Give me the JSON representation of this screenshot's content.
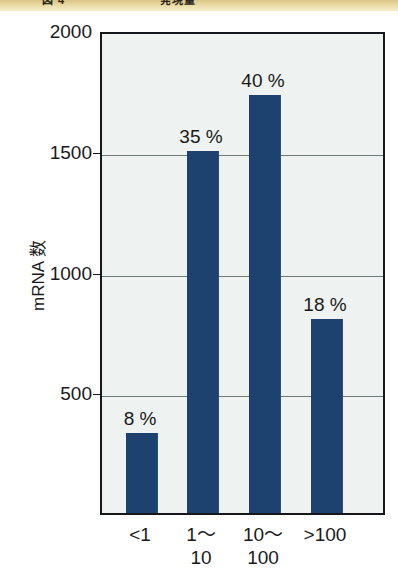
{
  "banner": {
    "left_fragment": "図 4",
    "right_fragment": "発現量"
  },
  "chart_data": {
    "type": "bar",
    "title": "",
    "subtitle": "",
    "xlabel": "",
    "ylabel": "mRNA 数",
    "ylim": [
      0,
      2000
    ],
    "grid": true,
    "legend": "none",
    "categories": [
      "<1",
      "1〜\n10",
      "10〜\n100",
      ">100"
    ],
    "category_plain": [
      "<1",
      "1〜10",
      "10〜100",
      ">100"
    ],
    "values": [
      330,
      1500,
      1730,
      805
    ],
    "data_labels": [
      "8 %",
      "35 %",
      "40 %",
      "18 %"
    ],
    "percentages": [
      8,
      35,
      40,
      18
    ],
    "yticks": [
      2000,
      1500,
      1000,
      500
    ],
    "ytick_labels": [
      "2000",
      "1500",
      "1000",
      "500"
    ],
    "bar_color": "#1e4270",
    "plot_background": "#eef2f0",
    "frame_color": "#15181a",
    "gridline_color": "#6f7b7a",
    "banner_color": "#e6d69c"
  }
}
